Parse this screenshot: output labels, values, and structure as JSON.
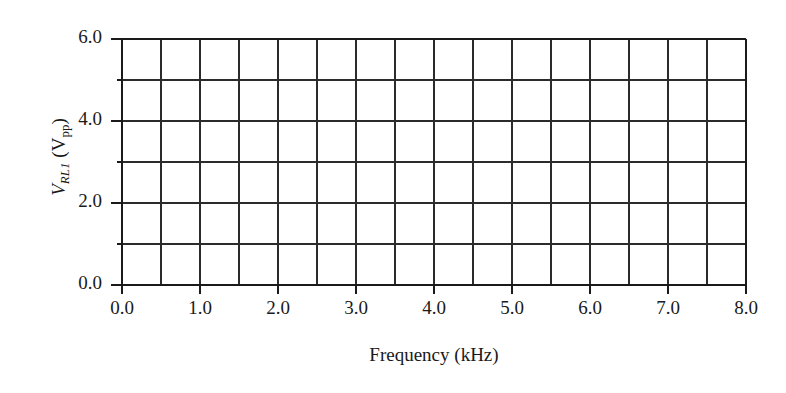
{
  "chart_data": {
    "type": "line",
    "title": "",
    "subtitle": "",
    "xlabel": "Frequency (kHz)",
    "ylabel": "V_RL1 (V_pp)",
    "ylabel_parts": {
      "symbol": "V",
      "subscript": "RL1",
      "unit_open": " (V",
      "unit_subscript": "pp",
      "unit_close": ")"
    },
    "xlim": [
      0.0,
      8.0
    ],
    "ylim": [
      0.0,
      6.0
    ],
    "xticks": [
      "0.0",
      "1.0",
      "2.0",
      "3.0",
      "4.0",
      "5.0",
      "6.0",
      "7.0",
      "8.0"
    ],
    "xtick_values": [
      0.0,
      1.0,
      2.0,
      3.0,
      4.0,
      5.0,
      6.0,
      7.0,
      8.0
    ],
    "yticks": [
      "0.0",
      "2.0",
      "4.0",
      "6.0"
    ],
    "ytick_values": [
      0.0,
      2.0,
      4.0,
      6.0
    ],
    "x_gridline_values": [
      0.0,
      0.5,
      1.0,
      1.5,
      2.0,
      2.5,
      3.0,
      3.5,
      4.0,
      4.5,
      5.0,
      5.5,
      6.0,
      6.5,
      7.0,
      7.5,
      8.0
    ],
    "y_gridline_values": [
      0.0,
      1.0,
      2.0,
      3.0,
      4.0,
      5.0,
      6.0
    ],
    "x_major_step": 1.0,
    "x_minor_step": 0.5,
    "y_major_step": 2.0,
    "y_minor_step": 1.0,
    "grid": true,
    "legend": false,
    "series": [],
    "values": [],
    "categories": [],
    "colors": {
      "background": "#ffffff",
      "grid": "#2b2b2b",
      "axis": "#1a1a1a",
      "text": "#1a1a1a"
    }
  }
}
